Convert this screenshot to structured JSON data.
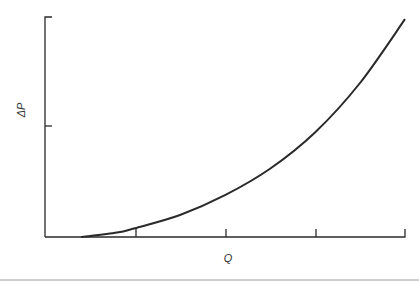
{
  "chart_data": {
    "type": "line",
    "title": "",
    "xlabel": "Q",
    "ylabel": "ΔP",
    "x_ticks": [
      "",
      "",
      "",
      ""
    ],
    "y_ticks": [
      "",
      ""
    ],
    "grid": false,
    "legend": null,
    "xlim": [
      0,
      4
    ],
    "ylim": [
      0,
      2
    ],
    "series": [
      {
        "name": "ΔP vs Q",
        "x": [
          0.4,
          0.8,
          1.0,
          1.5,
          2.0,
          2.5,
          3.0,
          3.5,
          4.0
        ],
        "y": [
          0.0,
          0.04,
          0.08,
          0.2,
          0.38,
          0.62,
          0.95,
          1.4,
          1.98
        ]
      }
    ]
  },
  "labels": {
    "x_axis": "Q",
    "y_axis": "ΔP"
  }
}
